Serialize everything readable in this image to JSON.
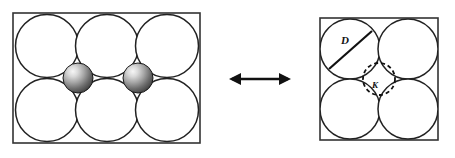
{
  "figure": {
    "background_color": "#ffffff",
    "line_color": "#222222",
    "relation_symbol": "double-headed-arrow"
  },
  "left_panel": {
    "name": "dense-packing-with-interstitial-spheres",
    "border": {
      "x": 13,
      "y": 13,
      "width": 187,
      "height": 130,
      "stroke": "#333333",
      "stroke_width": 1.6,
      "fill": "#ffffff"
    },
    "large_circles": {
      "count": 6,
      "radius": 31.5,
      "fill": "#ffffff",
      "stroke": "#222222",
      "stroke_width": 1.5,
      "centers": [
        {
          "cx": 47,
          "cy": 46
        },
        {
          "cx": 107,
          "cy": 46
        },
        {
          "cx": 167,
          "cy": 46
        },
        {
          "cx": 47,
          "cy": 110
        },
        {
          "cx": 107,
          "cy": 110
        },
        {
          "cx": 167,
          "cy": 110
        }
      ]
    },
    "interstitial_spheres": {
      "count": 2,
      "radius": 15,
      "base_color": "#6f6f6f",
      "highlight_color": "#f2f2f2",
      "shadow_color": "#3a3a3a",
      "stroke": "#1a1a1a",
      "centers": [
        {
          "cx": 78,
          "cy": 78
        },
        {
          "cx": 138,
          "cy": 78
        }
      ]
    }
  },
  "arrow": {
    "name": "equivalence-arrow",
    "x1": 229,
    "x2": 291,
    "y": 79,
    "stroke": "#111111",
    "stroke_width": 2.6,
    "head_length": 11,
    "head_half_width": 6
  },
  "right_panel": {
    "name": "square-unit-cell",
    "border": {
      "x": 320,
      "y": 18,
      "width": 118,
      "height": 122,
      "stroke": "#333333",
      "stroke_width": 1.6,
      "fill": "#ffffff"
    },
    "large_circles": {
      "count": 4,
      "radius": 30,
      "fill": "#ffffff",
      "stroke": "#222222",
      "stroke_width": 1.5,
      "centers": [
        {
          "cx": 350,
          "cy": 49
        },
        {
          "cx": 408,
          "cy": 49
        },
        {
          "cx": 350,
          "cy": 109
        },
        {
          "cx": 408,
          "cy": 109
        }
      ]
    },
    "diameter_line": {
      "name": "diameter-line",
      "x1": 329,
      "y1": 69,
      "x2": 372,
      "y2": 31,
      "stroke": "#111111",
      "stroke_width": 2.2
    },
    "diameter_label": {
      "text": "D",
      "x": 345,
      "y": 44,
      "font_size": 11
    },
    "interstitial_circle": {
      "name": "interstitial-void-circle",
      "cx": 379,
      "cy": 79,
      "r": 16,
      "stroke": "#111111",
      "stroke_width": 1.8,
      "dash": "4 3",
      "fill": "none"
    },
    "interstitial_label": {
      "text": "K",
      "x": 374,
      "y": 88,
      "font_size": 9
    }
  }
}
